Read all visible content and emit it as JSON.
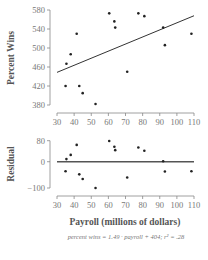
{
  "chart_data": [
    {
      "type": "scatter",
      "title": "",
      "xlabel": "",
      "ylabel": "Percent Wins",
      "xlim": [
        30,
        110
      ],
      "ylim": [
        380,
        580
      ],
      "xticks": [
        30,
        40,
        50,
        60,
        70,
        80,
        90,
        100,
        110
      ],
      "yticks": [
        380,
        420,
        460,
        500,
        540,
        580
      ],
      "grid": false,
      "points": [
        {
          "x": 35,
          "y": 420
        },
        {
          "x": 35.5,
          "y": 467
        },
        {
          "x": 38,
          "y": 487
        },
        {
          "x": 41.5,
          "y": 530
        },
        {
          "x": 43,
          "y": 420
        },
        {
          "x": 45,
          "y": 405
        },
        {
          "x": 52.5,
          "y": 382
        },
        {
          "x": 60.5,
          "y": 573
        },
        {
          "x": 63.5,
          "y": 556
        },
        {
          "x": 64,
          "y": 543
        },
        {
          "x": 71,
          "y": 450
        },
        {
          "x": 77.5,
          "y": 573
        },
        {
          "x": 81,
          "y": 567
        },
        {
          "x": 92,
          "y": 543
        },
        {
          "x": 93,
          "y": 506
        },
        {
          "x": 108.5,
          "y": 530
        }
      ],
      "regression": {
        "slope": 1.49,
        "intercept": 404,
        "x_range": [
          30,
          110
        ]
      }
    },
    {
      "type": "scatter",
      "title": "",
      "xlabel": "Payroll (millions of dollars)",
      "ylabel": "Residual",
      "xlim": [
        30,
        110
      ],
      "ylim": [
        -100,
        80
      ],
      "xticks": [
        30,
        40,
        50,
        60,
        70,
        80,
        90,
        100,
        110
      ],
      "yticks": [
        -100,
        0,
        80
      ],
      "grid": false,
      "reference_line": 0,
      "points": [
        {
          "x": 35,
          "y": -36
        },
        {
          "x": 35.5,
          "y": 10
        },
        {
          "x": 38,
          "y": 26
        },
        {
          "x": 41.5,
          "y": 64
        },
        {
          "x": 43,
          "y": -48
        },
        {
          "x": 45,
          "y": -66
        },
        {
          "x": 52.5,
          "y": -100
        },
        {
          "x": 60.5,
          "y": 79
        },
        {
          "x": 63.5,
          "y": 57
        },
        {
          "x": 64,
          "y": 44
        },
        {
          "x": 71,
          "y": -60
        },
        {
          "x": 77.5,
          "y": 54
        },
        {
          "x": 81,
          "y": 42
        },
        {
          "x": 92,
          "y": 2
        },
        {
          "x": 93,
          "y": -37
        },
        {
          "x": 108.5,
          "y": -36
        }
      ]
    }
  ],
  "caption": "percent wins = 1.49 · payroll + 404; r² = .28"
}
